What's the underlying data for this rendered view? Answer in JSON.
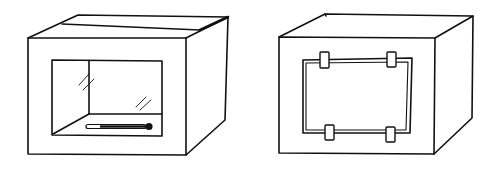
{
  "figure": {
    "left_box": {
      "label": "box-with-glass-window-and-thermometer"
    },
    "right_box": {
      "label": "box-with-taped-panel"
    },
    "colors": {
      "line": "#111111",
      "background": "#ffffff"
    }
  }
}
